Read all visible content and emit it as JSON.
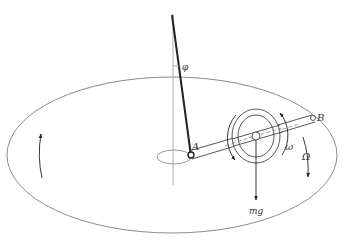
{
  "diagram": {
    "labels": {
      "phi": "φ",
      "point_a": "A",
      "point_b": "B",
      "omega_small": "ω",
      "omega_large": "Ω",
      "weight": "mg"
    },
    "colors": {
      "line": "#222222",
      "light_line": "#9a9a9a",
      "ellipse": "#8c8c8c",
      "text": "#333333"
    }
  }
}
